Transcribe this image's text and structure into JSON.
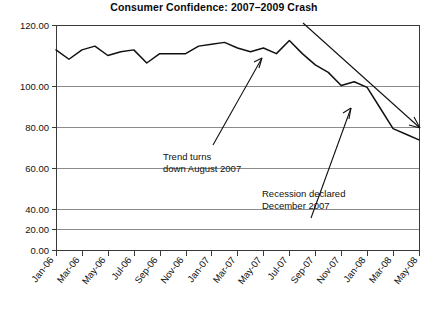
{
  "chart_data": {
    "type": "line",
    "title": "Consumer Confidence: 2007–2009 Crash",
    "xlabel": "",
    "ylabel": "",
    "ylim": [
      0,
      120
    ],
    "ytick_labels": [
      "120.00",
      "100.00",
      "80.00",
      "60.00",
      "40.00",
      "20.00",
      "0.00"
    ],
    "ytick_values": [
      120,
      100,
      80,
      60,
      40,
      20,
      0
    ],
    "grid": true,
    "legend": "none",
    "xtick_labels": [
      "Jan-06",
      "Mar-06",
      "May-06",
      "Jul-06",
      "Sep-06",
      "Nov-06",
      "Jan-07",
      "Mar-07",
      "May-07",
      "Jul-07",
      "Sep-07",
      "Nov-07",
      "Jan-08",
      "Mar-08",
      "May-08"
    ],
    "categories": [
      "Jan-06",
      "Feb-06",
      "Mar-06",
      "Apr-06",
      "May-06",
      "Jun-06",
      "Jul-06",
      "Aug-06",
      "Sep-06",
      "Oct-06",
      "Nov-06",
      "Dec-06",
      "Jan-07",
      "Feb-07",
      "Mar-07",
      "Apr-07",
      "May-07",
      "Jun-07",
      "Jul-07",
      "Aug-07",
      "Sep-07",
      "Oct-07",
      "Nov-07",
      "Dec-07",
      "Jan-08",
      "Feb-08",
      "Mar-08",
      "Apr-08",
      "May-08"
    ],
    "values": [
      107,
      102,
      107,
      109,
      104,
      106,
      107,
      100,
      105,
      105,
      105,
      109,
      110,
      111,
      108,
      106,
      108,
      105,
      112,
      105,
      99,
      95,
      88,
      90,
      87,
      76,
      65,
      62,
      59
    ],
    "annotations": [
      {
        "id": "trend-turns",
        "line1": "Trend turns",
        "line2": "down August 2007",
        "points_to": "Jul-07 peak"
      },
      {
        "id": "recession-declared",
        "line1": "Recession declared",
        "line2": "December 2007",
        "points_to": "Jan-08 decline"
      }
    ],
    "trend_arrow": {
      "label": "downward trend arrow",
      "from": "Sep-07 top",
      "to": "May-08 right edge"
    }
  },
  "axis_colors": {
    "grid": "#8b8b8b",
    "axis": "#3a3a3a",
    "series": "#111111"
  }
}
